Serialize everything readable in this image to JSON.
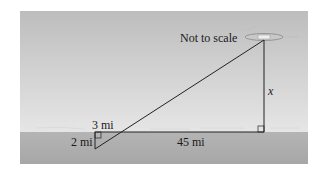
{
  "diagram": {
    "note": "Not to scale",
    "labels": {
      "small_horizontal": "3 mi",
      "small_vertical": "2 mi",
      "large_horizontal": "45 mi",
      "large_vertical": "x"
    },
    "colors": {
      "sky_top": "#bdbdbd",
      "sky_bottom": "#ececec",
      "water": "#aaaaaa",
      "lines": "#222222"
    }
  }
}
